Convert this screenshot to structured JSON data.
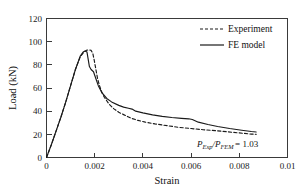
{
  "chart_data": {
    "type": "line",
    "title": "",
    "xlabel": "Strain",
    "ylabel": "Load (kN)",
    "xlim": [
      0,
      0.01
    ],
    "ylim": [
      0,
      120
    ],
    "xticks": [
      0,
      0.002,
      0.004,
      0.006,
      0.008,
      0.01
    ],
    "xtick_labels": [
      "0",
      "0.002",
      "0.004",
      "0.006",
      "0.008",
      "0.01"
    ],
    "yticks": [
      0,
      20,
      40,
      60,
      80,
      100,
      120
    ],
    "ytick_labels": [
      "0",
      "20",
      "40",
      "60",
      "80",
      "100",
      "120"
    ],
    "grid": false,
    "legend_position": "top-right",
    "frame": "box",
    "tick_direction": "in",
    "series": [
      {
        "name": "Experiment",
        "style": "dashed",
        "color": "#1a1a1a",
        "x": [
          0,
          0.0002,
          0.0004,
          0.0006,
          0.0008,
          0.001,
          0.0012,
          0.0014,
          0.00155,
          0.00165,
          0.00175,
          0.00185,
          0.00192,
          0.00198,
          0.00205,
          0.00212,
          0.0022,
          0.0023,
          0.0024,
          0.0026,
          0.0028,
          0.003,
          0.0032,
          0.0035,
          0.0038,
          0.0041,
          0.0045,
          0.005,
          0.0055,
          0.006,
          0.0065,
          0.007,
          0.0075,
          0.008,
          0.0085,
          0.0087
        ],
        "y": [
          0,
          11,
          23,
          35,
          48,
          62,
          76,
          87,
          91,
          92.5,
          93,
          92.5,
          90,
          84,
          76,
          68,
          62,
          56,
          52,
          46,
          42,
          39,
          37,
          34,
          32,
          30.5,
          29,
          27.5,
          26,
          25,
          24,
          23.2,
          22.2,
          21.2,
          20.2,
          20
        ]
      },
      {
        "name": "FE model",
        "style": "solid",
        "color": "#1a1a1a",
        "x": [
          0,
          0.0002,
          0.0004,
          0.0006,
          0.0008,
          0.001,
          0.0012,
          0.0014,
          0.00152,
          0.0016,
          0.00168,
          0.00172,
          0.00178,
          0.00185,
          0.00195,
          0.00205,
          0.00215,
          0.0023,
          0.0025,
          0.0027,
          0.003,
          0.0032,
          0.0034,
          0.00355,
          0.0037,
          0.004,
          0.0044,
          0.0048,
          0.0052,
          0.0056,
          0.0059,
          0.00605,
          0.0063,
          0.0067,
          0.0071,
          0.0076,
          0.0081,
          0.0085,
          0.0087
        ],
        "y": [
          0,
          11,
          23,
          35,
          48,
          62,
          76,
          87.5,
          91,
          92,
          91,
          86,
          78.5,
          76,
          74,
          68,
          62,
          56,
          51,
          48,
          45,
          43.5,
          42.5,
          41.8,
          40,
          38.5,
          36.8,
          35.5,
          34.5,
          33.8,
          33.4,
          32.8,
          30.5,
          28.5,
          26.8,
          25,
          23.5,
          22.4,
          22
        ]
      }
    ],
    "annotations": [
      {
        "name": "ratio-annotation",
        "numerator_symbol": "P",
        "numerator_sub": "Exp",
        "denominator_symbol": "P",
        "denominator_sub": "FEM",
        "separator": "/",
        "equals": "= 1.03",
        "x": 0.0062,
        "y": 8
      }
    ]
  },
  "legend": {
    "entries": [
      {
        "label": "Experiment",
        "style": "dashed"
      },
      {
        "label": "FE model",
        "style": "solid"
      }
    ]
  }
}
